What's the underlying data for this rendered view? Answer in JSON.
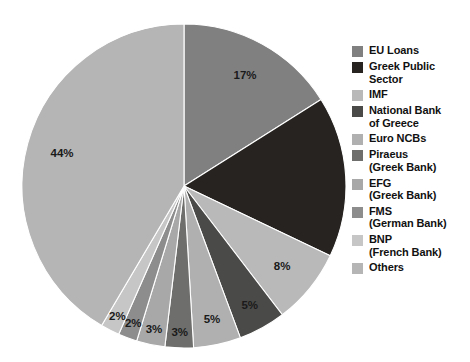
{
  "chart_data": {
    "type": "pie",
    "title": "",
    "subtitle": "",
    "xlabel": "",
    "ylabel": "",
    "grid": false,
    "legend_position": "right",
    "start_angle_deg": 0,
    "direction": "clockwise",
    "categories": [
      "EU Loans",
      "Greek Public Sector",
      "IMF",
      "National Bank of Greece",
      "Euro NCBs",
      "Piraeus (Greek Bank)",
      "EFG (Greek Bank)",
      "FMS (German Bank)",
      "BNP (French Bank)",
      "Others"
    ],
    "values": [
      17,
      17,
      8,
      5,
      5,
      3,
      3,
      2,
      2,
      44
    ],
    "value_labels": [
      "17%",
      "17%",
      "8%",
      "5%",
      "5%",
      "3%",
      "3%",
      "2%",
      "2%",
      "44%"
    ],
    "shown_value_labels": [
      "17%",
      "8%",
      "5%",
      "5%",
      "3%",
      "3%",
      "2%",
      "2%",
      "44%"
    ],
    "colors": [
      "#808080",
      "#262320",
      "#b9b9b9",
      "#4a4a48",
      "#b0b0b0",
      "#6e6e6c",
      "#a8a8a8",
      "#8d8d8d",
      "#c6c6c6",
      "#b5b5b5"
    ],
    "slices": [
      {
        "label": "EU Loans",
        "value": 17,
        "value_label": "17%",
        "color": "#808080",
        "label_visible": true
      },
      {
        "label": "Greek Public Sector",
        "value": 17,
        "value_label": "17%",
        "color": "#262320",
        "label_visible": false
      },
      {
        "label": "IMF",
        "value": 8,
        "value_label": "8%",
        "color": "#b9b9b9",
        "label_visible": true
      },
      {
        "label": "National Bank of Greece",
        "value": 5,
        "value_label": "5%",
        "color": "#4a4a48",
        "label_visible": true
      },
      {
        "label": "Euro NCBs",
        "value": 5,
        "value_label": "5%",
        "color": "#b0b0b0",
        "label_visible": true
      },
      {
        "label": "Piraeus (Greek Bank)",
        "value": 3,
        "value_label": "3%",
        "color": "#6e6e6c",
        "label_visible": true
      },
      {
        "label": "EFG (Greek Bank)",
        "value": 3,
        "value_label": "3%",
        "color": "#a8a8a8",
        "label_visible": true
      },
      {
        "label": "FMS (German Bank)",
        "value": 2,
        "value_label": "2%",
        "color": "#8d8d8d",
        "label_visible": true
      },
      {
        "label": "BNP (French Bank)",
        "value": 2,
        "value_label": "2%",
        "color": "#c6c6c6",
        "label_visible": true
      },
      {
        "label": "Others",
        "value": 44,
        "value_label": "44%",
        "color": "#b5b5b5",
        "label_visible": true
      }
    ]
  },
  "legend": {
    "items": [
      {
        "label": "EU Loans",
        "color": "#808080"
      },
      {
        "label": "Greek Public\nSector",
        "color": "#262320"
      },
      {
        "label": "IMF",
        "color": "#b9b9b9"
      },
      {
        "label": "National Bank\nof Greece",
        "color": "#4a4a48"
      },
      {
        "label": "Euro NCBs",
        "color": "#b0b0b0"
      },
      {
        "label": "Piraeus\n(Greek Bank)",
        "color": "#6e6e6c"
      },
      {
        "label": "EFG\n(Greek Bank)",
        "color": "#a8a8a8"
      },
      {
        "label": "FMS\n(German Bank)",
        "color": "#8d8d8d"
      },
      {
        "label": "BNP\n(French Bank)",
        "color": "#c6c6c6"
      },
      {
        "label": "Others",
        "color": "#b5b5b5"
      }
    ]
  },
  "geometry": {
    "center_x": 184,
    "center_y": 186,
    "radius": 162,
    "label_radius_ratio": 0.78
  }
}
